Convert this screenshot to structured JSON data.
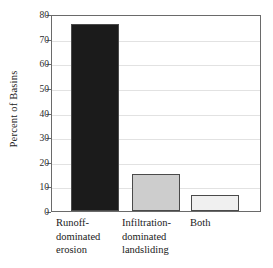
{
  "chart_data": {
    "type": "bar",
    "title": "",
    "xlabel": "",
    "ylabel": "Percent of Basins",
    "categories": [
      "Runoff-dominated erosion",
      "Infiltration-dominated landsliding",
      "Both"
    ],
    "category_lines": [
      "Runoff-\ndominated\nerosion",
      "Infiltration-\ndominated\nlandsliding",
      "Both"
    ],
    "values": [
      76,
      15,
      6.5
    ],
    "ylim": [
      0,
      80
    ],
    "ytick_labels": [
      "0",
      "10",
      "20",
      "30",
      "40",
      "50",
      "60",
      "70",
      "80"
    ],
    "ytick_values": [
      0,
      10,
      20,
      30,
      40,
      50,
      60,
      70,
      80
    ],
    "grid": true,
    "legend": "none",
    "bar_colors": [
      "#1b1b1b",
      "#cdcdcd",
      "#f0f0f0"
    ],
    "bar_edge_color": "#4a4a4a",
    "axis_color": "#6a6a6a",
    "grid_color": "#e2e2e2",
    "background": "#ffffff"
  }
}
